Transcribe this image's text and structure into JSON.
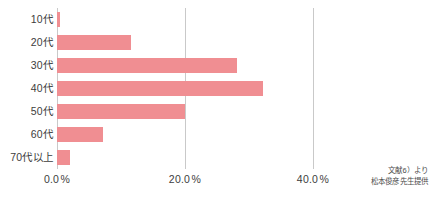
{
  "chart_data": {
    "type": "bar",
    "orientation": "horizontal",
    "title": "",
    "xlabel": "",
    "ylabel": "",
    "categories": [
      "10代",
      "20代",
      "30代",
      "40代",
      "50代",
      "60代",
      "70代以上"
    ],
    "values": [
      0.5,
      11.6,
      28.1,
      32.2,
      20.0,
      7.2,
      2.0
    ],
    "xlim": [
      0.0,
      40.0
    ],
    "xticks": [
      0.0,
      20.0,
      40.0
    ],
    "xtick_labels": [
      "0.0",
      "20.0",
      "40.0"
    ],
    "xtick_unit": "%",
    "grid": "vertical",
    "legend": "none",
    "bar_color": "#f08e92",
    "gridline_color": "#c9c9c9",
    "text_color": "#3d3d3d"
  },
  "attribution": {
    "line1": "文献6）より",
    "line2": "松本俊彦先生提供"
  }
}
